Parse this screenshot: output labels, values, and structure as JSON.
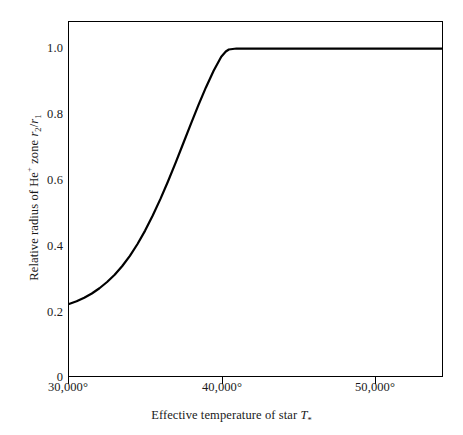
{
  "chart_data": {
    "type": "line",
    "title": "",
    "subtitle": "",
    "xlabel": "Effective temperature of star T*",
    "xlabel_parts": {
      "text": "Effective temperature of star ",
      "symbol": "T",
      "symbol_sub": "*"
    },
    "ylabel": "Relative radius of He+ zone r2/r1",
    "ylabel_parts": {
      "text1": "Relative radius of He",
      "sup": "+",
      "text2": " zone ",
      "num": "r",
      "num_sub": "2",
      "slash": "/",
      "den": "r",
      "den_sub": "1"
    },
    "xlim": [
      30000,
      54500
    ],
    "ylim": [
      0,
      1.081
    ],
    "xticks": [
      30000,
      40000,
      50000
    ],
    "xticklabels": [
      "30,000°",
      "40,000°",
      "50,000°"
    ],
    "yticks": [
      0,
      0.2,
      0.4,
      0.6,
      0.8,
      1.0
    ],
    "yticklabels": [
      "0",
      "0.2",
      "0.4",
      "0.6",
      "0.8",
      "1.0"
    ],
    "grid": false,
    "legend": null,
    "legend_position": "none",
    "line_color": "#000000",
    "line_width": 2.2,
    "axis_color": "#000000",
    "background_color": "#ffffff",
    "tick_direction": "in",
    "series": [
      {
        "name": "Relative radius of He+ zone",
        "x": [
          30000,
          30500,
          31000,
          31500,
          32000,
          32500,
          33000,
          33500,
          34000,
          34500,
          35000,
          35500,
          36000,
          36500,
          37000,
          37500,
          38000,
          38500,
          39000,
          39500,
          40000,
          40300,
          40500,
          41000,
          42000,
          44000,
          46000,
          48000,
          50000,
          52000,
          54500
        ],
        "y": [
          0.22,
          0.228,
          0.239,
          0.252,
          0.268,
          0.287,
          0.309,
          0.336,
          0.367,
          0.403,
          0.444,
          0.49,
          0.54,
          0.594,
          0.651,
          0.71,
          0.769,
          0.827,
          0.882,
          0.932,
          0.975,
          0.991,
          0.997,
          1.0,
          1.0,
          1.0,
          1.0,
          1.0,
          1.0,
          1.0,
          1.0
        ]
      }
    ],
    "annotations": [
      {
        "label": "start-value",
        "x": 30000,
        "y": 0.22
      },
      {
        "label": "saturation-onset",
        "x": 40500,
        "y": 1.0
      }
    ]
  }
}
